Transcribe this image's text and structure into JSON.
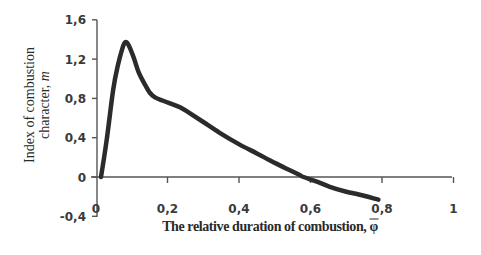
{
  "chart_data": {
    "type": "line",
    "title": "",
    "xlabel": "The relative duration of combustion, φ̄",
    "xlabel_text": "The relative duration of combustion, ",
    "xlabel_symbol": "φ",
    "ylabel": "Index of combustion character, m",
    "ylabel_line1": "Index of combustion",
    "ylabel_line2": "character, ",
    "ylabel_symbol": "m",
    "xlim": [
      0,
      1
    ],
    "ylim": [
      -0.4,
      1.6
    ],
    "grid": false,
    "legend": null,
    "x_ticks": [
      {
        "value": 0,
        "label": "0"
      },
      {
        "value": 0.2,
        "label": "0,2"
      },
      {
        "value": 0.4,
        "label": "0,4"
      },
      {
        "value": 0.6,
        "label": "0,6"
      },
      {
        "value": 0.8,
        "label": "0,8"
      },
      {
        "value": 1,
        "label": "1"
      }
    ],
    "y_ticks": [
      {
        "value": 1.6,
        "label": "1,6"
      },
      {
        "value": 1.2,
        "label": "1,2"
      },
      {
        "value": 0.8,
        "label": "0,8"
      },
      {
        "value": 0.4,
        "label": "0,4"
      },
      {
        "value": 0,
        "label": "0"
      },
      {
        "value": -0.4,
        "label": "-0,4"
      }
    ],
    "series": [
      {
        "name": "m",
        "color": "#2b2b2b",
        "x": [
          0.014,
          0.03,
          0.048,
          0.062,
          0.073,
          0.081,
          0.09,
          0.105,
          0.12,
          0.137,
          0.15,
          0.165,
          0.185,
          0.207,
          0.235,
          0.262,
          0.3,
          0.346,
          0.402,
          0.45,
          0.486,
          0.53,
          0.57,
          0.58,
          0.62,
          0.654,
          0.7,
          0.738,
          0.79
        ],
        "values": [
          0.0,
          0.38,
          0.89,
          1.15,
          1.3,
          1.37,
          1.35,
          1.22,
          1.06,
          0.94,
          0.86,
          0.81,
          0.78,
          0.75,
          0.71,
          0.65,
          0.56,
          0.45,
          0.33,
          0.24,
          0.17,
          0.09,
          0.02,
          0.0,
          -0.05,
          -0.1,
          -0.15,
          -0.18,
          -0.23
        ]
      }
    ]
  }
}
